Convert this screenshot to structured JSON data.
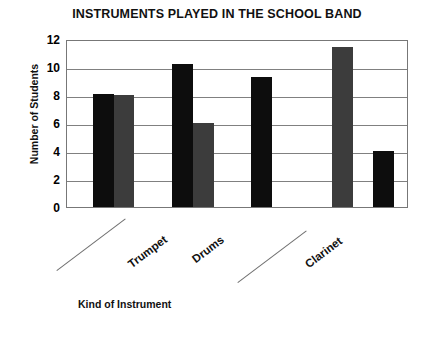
{
  "chart_data": {
    "type": "bar",
    "title": "INSTRUMENTS PLAYED IN THE SCHOOL BAND",
    "xlabel": "Kind of Instrument",
    "ylabel": "Number of Students",
    "ylim": [
      0,
      12
    ],
    "yticks": [
      0,
      2,
      4,
      6,
      8,
      10,
      12
    ],
    "ytick_labels": [
      "0",
      "2",
      "4",
      "6",
      "8",
      "10",
      "12"
    ],
    "grid": true,
    "legend": "none",
    "categories": [
      "",
      "Trumpet",
      "Drums",
      "",
      "Clarinet"
    ],
    "bars": [
      {
        "label": "",
        "value": 8.1,
        "color": "#0d0d0d",
        "x_pct": 7.6,
        "width_pct": 6.1
      },
      {
        "label": "",
        "value": 8.0,
        "color": "#3c3c3c",
        "x_pct": 13.7,
        "width_pct": 6.1
      },
      {
        "label": "Trumpet",
        "value": 10.2,
        "color": "#0d0d0d",
        "x_pct": 31.0,
        "width_pct": 6.1
      },
      {
        "label": "Trumpet",
        "value": 6.0,
        "color": "#3c3c3c",
        "x_pct": 37.1,
        "width_pct": 6.1
      },
      {
        "label": "Drums",
        "value": 9.3,
        "color": "#0d0d0d",
        "x_pct": 54.1,
        "width_pct": 6.1
      },
      {
        "label": "",
        "value": 11.4,
        "color": "#3c3c3c",
        "x_pct": 78.0,
        "width_pct": 6.1
      },
      {
        "label": "Clarinet",
        "value": 4.0,
        "color": "#0d0d0d",
        "x_pct": 90.0,
        "width_pct": 6.1
      }
    ],
    "category_labels": [
      {
        "text": "",
        "left": 57,
        "top": 270,
        "leader": true,
        "leader_len": 86
      },
      {
        "text": "Trumpet",
        "left": 133,
        "top": 258,
        "leader": false,
        "leader_len": 0
      },
      {
        "text": "Drums",
        "left": 197,
        "top": 253,
        "leader": false,
        "leader_len": 0
      },
      {
        "text": "",
        "left": 238,
        "top": 282,
        "leader": true,
        "leader_len": 86
      },
      {
        "text": "Clarinet",
        "left": 310,
        "top": 258,
        "leader": false,
        "leader_len": 0
      }
    ],
    "colors": {
      "series_dark": "#0d0d0d",
      "series_gray": "#3c3c3c",
      "grid": "#808080",
      "frame": "#777777",
      "background": "#ffffff",
      "text": "#111111"
    }
  }
}
